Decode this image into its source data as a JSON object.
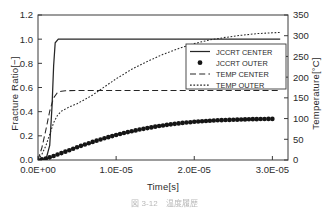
{
  "figure": {
    "caption": "図 3-12　温度履歴"
  },
  "chart_data": {
    "type": "line",
    "title": "",
    "xlabel": "Time[s]",
    "ylabel": "Fracture Ratio[−]",
    "ylabel_right": "Temperature[°C]",
    "grid": false,
    "legend_position": "center-right",
    "xlim": [
      0,
      3.2e-05
    ],
    "ylim": [
      0,
      1.2
    ],
    "ylim_right": [
      0,
      350
    ],
    "xticks": [
      0,
      1e-05,
      2e-05,
      3e-05
    ],
    "xtick_labels": [
      "0.0E+00",
      "1.0E-05",
      "2.0E-05",
      "3.0E-05"
    ],
    "yticks": [
      0.0,
      0.2,
      0.4,
      0.6,
      0.8,
      1.0,
      1.2
    ],
    "ytick_labels": [
      "0.0",
      "0.2",
      "0.4",
      "0.6",
      "0.8",
      "1.0",
      "1.2"
    ],
    "yticks_right": [
      0,
      50,
      100,
      150,
      200,
      250,
      300,
      350
    ],
    "ytick_labels_right": [
      "0",
      "50",
      "100",
      "150",
      "200",
      "250",
      "300",
      "350"
    ],
    "axis_color": "#3a3a3a",
    "series": [
      {
        "name": "JCCRT CENTER",
        "style": "solid",
        "axis": "left",
        "color": "#262626",
        "x": [
          0.0,
          1e-06,
          1.5e-06,
          1.8e-06,
          2e-06,
          2.2e-06,
          2.6e-06,
          3e-06,
          5e-06,
          1e-05,
          1.5e-05,
          2e-05,
          2.5e-05,
          3e-05,
          3.1e-05
        ],
        "values": [
          0.0,
          0.0,
          0.12,
          0.45,
          0.78,
          0.97,
          1.0,
          1.0,
          1.0,
          1.0,
          1.0,
          1.0,
          1.0,
          1.0,
          1.0
        ]
      },
      {
        "name": "JCCRT OUTER",
        "style": "markers",
        "marker": "filled-circle",
        "axis": "left",
        "color": "#151515",
        "x": [
          0.0,
          5e-07,
          1e-06,
          1.5e-06,
          2e-06,
          2.5e-06,
          3e-06,
          3.5e-06,
          4e-06,
          4.5e-06,
          5e-06,
          5.5e-06,
          6e-06,
          6.5e-06,
          7e-06,
          7.5e-06,
          8e-06,
          8.5e-06,
          9e-06,
          9.5e-06,
          1e-05,
          1.05e-05,
          1.1e-05,
          1.15e-05,
          1.2e-05,
          1.25e-05,
          1.3e-05,
          1.35e-05,
          1.4e-05,
          1.45e-05,
          1.5e-05,
          1.55e-05,
          1.6e-05,
          1.65e-05,
          1.7e-05,
          1.75e-05,
          1.8e-05,
          1.85e-05,
          1.9e-05,
          1.95e-05,
          2e-05,
          2.05e-05,
          2.1e-05,
          2.15e-05,
          2.2e-05,
          2.25e-05,
          2.3e-05,
          2.35e-05,
          2.4e-05,
          2.45e-05,
          2.5e-05,
          2.55e-05,
          2.6e-05,
          2.65e-05,
          2.7e-05,
          2.75e-05,
          2.8e-05,
          2.85e-05,
          2.9e-05,
          2.95e-05,
          3e-05
        ],
        "values": [
          0.0,
          0.005,
          0.012,
          0.022,
          0.033,
          0.045,
          0.057,
          0.069,
          0.081,
          0.093,
          0.105,
          0.117,
          0.128,
          0.139,
          0.15,
          0.16,
          0.17,
          0.18,
          0.189,
          0.198,
          0.207,
          0.215,
          0.223,
          0.231,
          0.238,
          0.245,
          0.252,
          0.258,
          0.264,
          0.27,
          0.276,
          0.281,
          0.286,
          0.291,
          0.295,
          0.299,
          0.303,
          0.307,
          0.31,
          0.313,
          0.316,
          0.319,
          0.321,
          0.323,
          0.325,
          0.327,
          0.329,
          0.33,
          0.331,
          0.332,
          0.333,
          0.334,
          0.335,
          0.336,
          0.337,
          0.338,
          0.338,
          0.339,
          0.339,
          0.34,
          0.34
        ]
      },
      {
        "name": "TEMP CENTER",
        "style": "dashed",
        "axis": "right",
        "color": "#262626",
        "x": [
          0.0,
          5e-07,
          1e-06,
          1.5e-06,
          2e-06,
          2.5e-06,
          3e-06,
          3.5e-06,
          4e-06,
          5e-06,
          6e-06,
          8e-06,
          1e-05,
          1.5e-05,
          2e-05,
          2.5e-05,
          3e-05,
          3.1e-05
        ],
        "values": [
          0,
          30,
          72,
          118,
          150,
          163,
          166,
          167,
          167.5,
          168,
          168,
          168,
          168,
          168,
          168,
          168,
          168,
          168
        ]
      },
      {
        "name": "TEMP OUTER",
        "style": "dotted",
        "axis": "right",
        "color": "#262626",
        "x": [
          0.0,
          5e-07,
          1e-06,
          1.5e-06,
          2e-06,
          2.5e-06,
          3e-06,
          4e-06,
          5e-06,
          6e-06,
          7e-06,
          8e-06,
          1e-05,
          1.2e-05,
          1.4e-05,
          1.6e-05,
          1.8e-05,
          2e-05,
          2.2e-05,
          2.4e-05,
          2.6e-05,
          2.8e-05,
          3e-05,
          3.1e-05
        ],
        "values": [
          0,
          14,
          34,
          62,
          90,
          108,
          118,
          128,
          136,
          146,
          157,
          170,
          196,
          219,
          238,
          255,
          269,
          281,
          290,
          296,
          301,
          305,
          307,
          308
        ]
      }
    ],
    "legend": [
      {
        "label": "JCCRT CENTER",
        "style": "solid"
      },
      {
        "label": "JCCRT OUTER",
        "style": "markers"
      },
      {
        "label": "TEMP CENTER",
        "style": "dashed"
      },
      {
        "label": "TEMP OUTER",
        "style": "dotted"
      }
    ]
  }
}
